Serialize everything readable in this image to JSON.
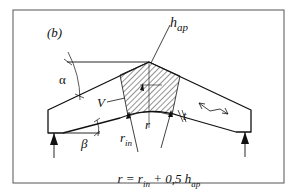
{
  "figure": {
    "panel_label": "(b)",
    "labels": {
      "alpha": "α",
      "beta": "β",
      "volume": "V",
      "radius": "r",
      "inner_radius_main": "r",
      "inner_radius_sub": "in",
      "apex_height_main": "h",
      "apex_height_sub": "ap",
      "thickness": "t"
    },
    "formula": {
      "lhs": "r = r",
      "sub1": "in",
      "mid": " + 0,5 h",
      "sub2": "ap"
    },
    "colors": {
      "line": "#111111",
      "frame": "#555555",
      "background": "#ffffff"
    }
  }
}
